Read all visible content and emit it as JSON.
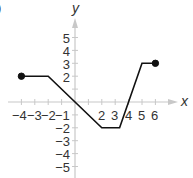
{
  "figure": {
    "panel_label_fragment": ")"
  },
  "chart_data": {
    "type": "line",
    "title": "",
    "xlabel": "x",
    "ylabel": "y",
    "x_ticks": [
      -4,
      -3,
      -2,
      -1,
      2,
      3,
      4,
      5,
      6
    ],
    "x_tick_labels": [
      "−4",
      "−3",
      "−2",
      "−1",
      "2",
      "3",
      "4",
      "5",
      "6"
    ],
    "y_ticks": [
      5,
      4,
      3,
      2,
      -1,
      -2,
      -3,
      -4,
      -5
    ],
    "y_tick_labels": [
      "5",
      "4",
      "3",
      "2",
      "−1",
      "−2",
      "−3",
      "−4",
      "−5"
    ],
    "xlim": [
      -4.5,
      7.5
    ],
    "ylim": [
      -5.8,
      6.4
    ],
    "grid": false,
    "legend": null,
    "series": [
      {
        "name": "f(x)",
        "x": [
          -4,
          -2,
          2,
          3.33,
          5,
          6
        ],
        "y": [
          2,
          2,
          -2,
          -2,
          3,
          3
        ],
        "color": "#111111"
      }
    ],
    "endpoints": [
      {
        "x": -4,
        "y": 2,
        "style": "closed"
      },
      {
        "x": 6,
        "y": 3,
        "style": "closed"
      }
    ],
    "colors": {
      "axis": "#c8c8c8",
      "line": "#111111",
      "text": "#333333"
    }
  }
}
